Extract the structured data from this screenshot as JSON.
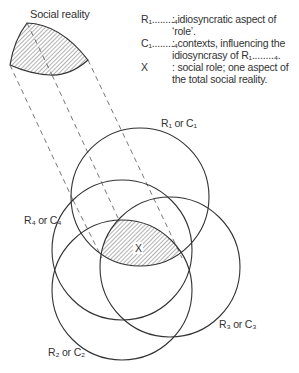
{
  "diagram": {
    "top_shape_label": "Social reality",
    "circles": [
      {
        "id": "1",
        "label": "R₁ or C₁",
        "cx": 140,
        "cy": 197,
        "r": 69
      },
      {
        "id": "2",
        "label": "R₂ or C₂",
        "cx": 122,
        "cy": 290,
        "r": 70
      },
      {
        "id": "3",
        "label": "R₃ or C₃",
        "cx": 170,
        "cy": 267,
        "r": 70
      },
      {
        "id": "4",
        "label": "R₄ or C₄",
        "cx": 122,
        "cy": 250,
        "r": 70
      }
    ],
    "center_label": "X",
    "legend": [
      {
        "key": "R₁........₄",
        "text": ": idiosyncratic aspect of ‘role’."
      },
      {
        "key": "C₁........₄",
        "text": ": contexts,  influencing the idiosyncrasy of R₁........₄."
      },
      {
        "key": "X",
        "text": ": social role; one aspect of the total social reality."
      }
    ],
    "colors": {
      "stroke": "#333333",
      "hatch": "#555555",
      "background": "#ffffff"
    }
  }
}
